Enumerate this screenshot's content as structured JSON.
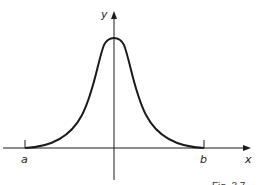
{
  "figure": {
    "caption": "Fig. 3.7",
    "axes": {
      "x_label": "x",
      "y_label": "y"
    },
    "points": {
      "a_label": "a",
      "b_label": "b"
    },
    "curve": {
      "shape": "bell-shaped curve symmetric about the y-axis",
      "description": "Smooth peaked curve with maximum on the y-axis, decaying to the x-axis at x=a and x=b"
    },
    "colors": {
      "stroke": "#1a1a1a",
      "background": "#ffffff"
    }
  }
}
